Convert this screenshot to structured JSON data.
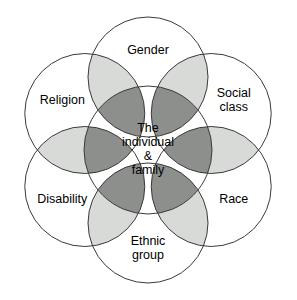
{
  "diagram": {
    "type": "venn-ring",
    "center": {
      "name": "center-node",
      "lines": [
        "The",
        "individual",
        "&",
        "family"
      ]
    },
    "nodes": [
      {
        "id": "gender",
        "label_lines": [
          "Gender"
        ],
        "angle_deg": -90
      },
      {
        "id": "social-class",
        "label_lines": [
          "Social",
          "class"
        ],
        "angle_deg": -30
      },
      {
        "id": "race",
        "label_lines": [
          "Race"
        ],
        "angle_deg": 30
      },
      {
        "id": "ethnic-group",
        "label_lines": [
          "Ethnic",
          "group"
        ],
        "angle_deg": 90
      },
      {
        "id": "disability",
        "label_lines": [
          "Disability"
        ],
        "angle_deg": 150
      },
      {
        "id": "religion",
        "label_lines": [
          "Religion"
        ],
        "angle_deg": 210
      },
      {
        "id": "region",
        "label_lines": [
          "Region"
        ],
        "angle_deg": 270
      }
    ],
    "colors": {
      "stroke": "#3a3a3a",
      "background": "#ffffff",
      "overlap_outer": "#d8dad8",
      "overlap_inner": "#8d8f8d",
      "text": "#000000"
    },
    "geometry": {
      "canvas_width": 297,
      "canvas_height": 300,
      "center_x": 148,
      "center_y": 150,
      "ring_radius": 73,
      "circle_radius": 60,
      "inner_circle_radius": 64,
      "node_count": 6
    }
  }
}
